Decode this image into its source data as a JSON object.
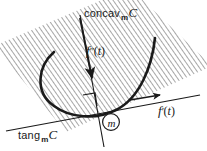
{
  "figure": {
    "background_color": "#ffffff",
    "ink_color": "#1a1a1a",
    "hatch_color": "#808080"
  },
  "labels": {
    "concav": {
      "word": "concav",
      "subscript": "m",
      "set": "C"
    },
    "tang": {
      "word": "tang",
      "subscript": "m",
      "set": "C"
    },
    "velocity": {
      "func": "f",
      "prime": "′",
      "open": "(",
      "var": "t",
      "close": ")"
    },
    "acceleration": {
      "func": "f",
      "prime": "″",
      "open": "(",
      "var": "t",
      "close": ")"
    },
    "point": {
      "name": "m"
    }
  },
  "elements": {
    "plane": "hatched-plane",
    "curve": "parabolic-curve-C",
    "tangent_line": "tangent-line",
    "normal_line": "concavity-line",
    "right_angle": "right-angle-marker",
    "point_marker": "circled-point-m"
  }
}
